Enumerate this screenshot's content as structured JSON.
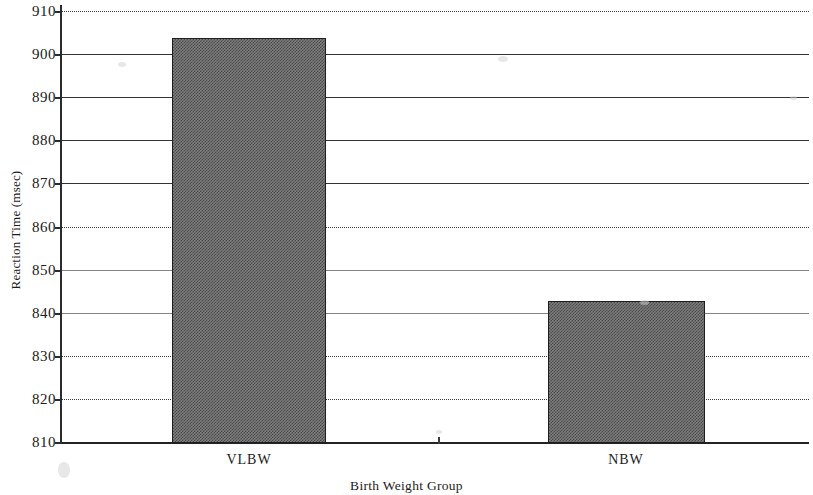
{
  "chart_data": {
    "type": "bar",
    "title": "",
    "xlabel": "Birth Weight Group",
    "ylabel": "Reaction Time (msec)",
    "categories": [
      "VLBW",
      "NBW"
    ],
    "values": [
      904,
      843
    ],
    "series": [
      {
        "name": "Reaction Time",
        "values": [
          904,
          843
        ]
      }
    ],
    "ylim": [
      810,
      910
    ],
    "ytick_step": 10,
    "yticks": [
      910,
      900,
      890,
      880,
      870,
      860,
      850,
      840,
      830,
      820,
      810
    ],
    "ytick_labels": [
      "910",
      "900",
      "890",
      "880",
      "870",
      "860",
      "850",
      "840",
      "830",
      "820",
      "810"
    ],
    "xticks": [
      "VLBW",
      "NBW"
    ],
    "grid": true,
    "grid_axis": "y",
    "legend": false,
    "legend_position": "none",
    "bar_fill": "#6f6f6f",
    "bar_edge_color": "#1e1e1e",
    "axis_color": "#2b2b2b",
    "background": "#ffffff",
    "annotations": []
  },
  "axes": {
    "y_title": "Reaction Time (msec)",
    "x_title": "Birth Weight Group"
  }
}
